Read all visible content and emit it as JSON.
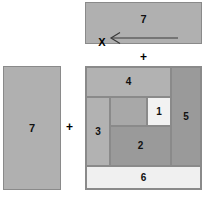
{
  "diagram": {
    "operators": {
      "plus_top": "+",
      "plus_middle": "+"
    },
    "marker": {
      "label": "X",
      "arrow_icon": "left-arrow-icon",
      "arrow_direction": "left"
    },
    "top_rect": {
      "label": "7",
      "fill": "#b0b0b0",
      "stroke": "#8a8a8a",
      "x": 85,
      "y": 2,
      "width": 117,
      "height": 42
    },
    "left_rect": {
      "label": "7",
      "fill": "#b0b0b0",
      "stroke": "#8a8a8a",
      "x": 3,
      "y": 66,
      "width": 58,
      "height": 124
    },
    "composite": {
      "x": 85,
      "y": 66,
      "width": 117,
      "height": 124,
      "stroke": "#8a8a8a",
      "pieces": [
        {
          "id": "sub-4",
          "label": "4",
          "fill": "#b2b2b2"
        },
        {
          "id": "sub-5",
          "label": "5",
          "fill": "#9a9a9a"
        },
        {
          "id": "sub-3",
          "label": "3",
          "fill": "#b2b2b2"
        },
        {
          "id": "sub-x",
          "label": "",
          "fill": "#a8a8a8"
        },
        {
          "id": "sub-1",
          "label": "1",
          "fill": "#f2f2f2"
        },
        {
          "id": "sub-2",
          "label": "2",
          "fill": "#9a9a9a"
        },
        {
          "id": "sub-6",
          "label": "6",
          "fill": "#f0f0f0"
        }
      ]
    },
    "colors": {
      "background": "#ffffff",
      "light_gray": "#f0f0f0",
      "mid_gray": "#b0b0b0",
      "dark_gray": "#9a9a9a",
      "outline": "#8a8a8a",
      "text": "#111111"
    }
  }
}
